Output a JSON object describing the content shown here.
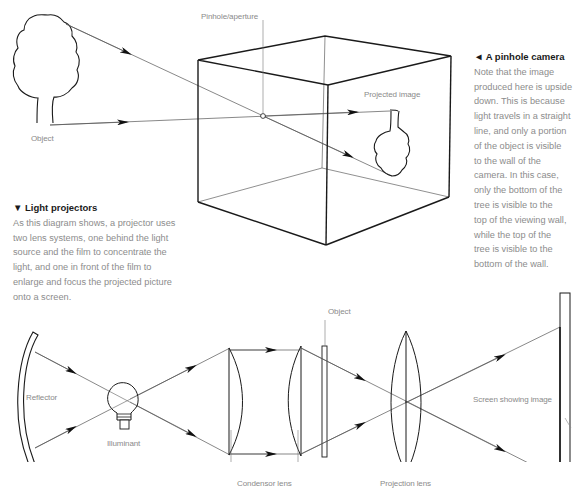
{
  "pinhole_camera": {
    "labels": {
      "pinhole": "Pinhole/aperture",
      "object": "Object",
      "projected_image": "Projected image"
    },
    "caption": {
      "marker": "◄",
      "title": "A pinhole camera",
      "body": "Note that the image\nproduced here is upside\ndown. This is because\nlight travels in a straight\nline, and only a portion\nof the object is visible\nto the wall of the\ncamera. In this case,\nonly the bottom of the\ntree is visible to the\ntop of the viewing wall,\nwhile the top of the\ntree is visible to the\nbottom of the wall."
    }
  },
  "light_projector": {
    "caption": {
      "marker": "▼",
      "title": "Light projectors",
      "body": "As this diagram shows, a projector uses\ntwo lens systems, one behind the light\nsource and the film to concentrate the\nlight, and one in front of the film to\nenlarge and focus the projected picture\nonto a screen."
    },
    "labels": {
      "reflector": "Reflector",
      "illuminant": "Illuminant",
      "condensor_lens": "Condensor lens",
      "object": "Object",
      "projection_lens": "Projection lens",
      "screen": "Screen showing image"
    }
  },
  "colors": {
    "line": "#1a1a1a",
    "ray": "#555555",
    "label": "#8a8a8a",
    "heading": "#1a1a1a"
  }
}
